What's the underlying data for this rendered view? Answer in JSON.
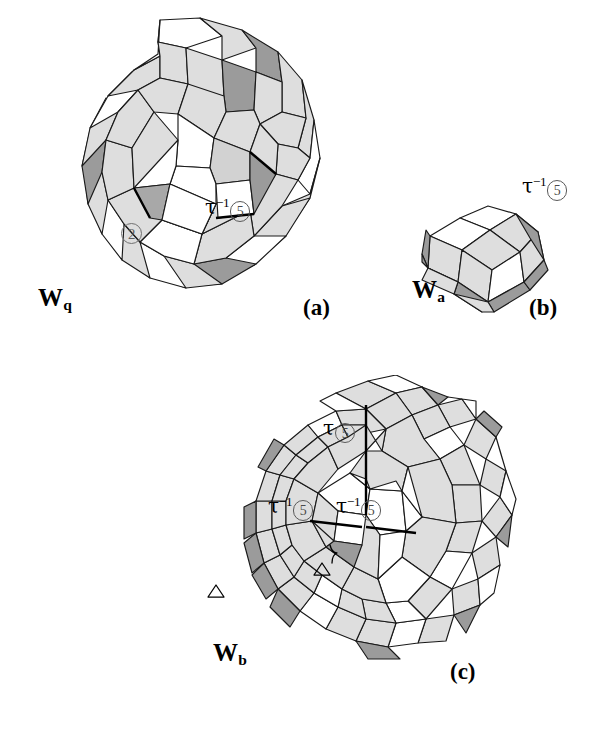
{
  "figure": {
    "type": "scientific-line-drawing",
    "background_color": "#ffffff",
    "face_colors": {
      "white": "#ffffff",
      "light_gray": "#dedede",
      "mid_gray": "#d2d2d2",
      "dark_gray": "#9b9b9b"
    },
    "edge_color": "#1a1a1a"
  },
  "panels": [
    {
      "id": "a",
      "panel_label": "(a)",
      "cluster_label": "W",
      "cluster_subscript": "q",
      "annotations": [
        {
          "name": "tau-inverse-5",
          "tau": "τ",
          "exponent": "−1",
          "circled": "5"
        },
        {
          "name": "circled-2",
          "circled": "2"
        }
      ]
    },
    {
      "id": "b",
      "panel_label": "(b)",
      "cluster_label": "W",
      "cluster_subscript": "a",
      "annotations": [
        {
          "name": "tau-inverse-5",
          "tau": "τ",
          "exponent": "−1",
          "circled": "5"
        }
      ]
    },
    {
      "id": "c",
      "panel_label": "(c)",
      "cluster_label": "W",
      "cluster_subscript": "b",
      "annotations": [
        {
          "name": "tau-5",
          "tau": "τ",
          "exponent": "",
          "circled": "5"
        },
        {
          "name": "tau-inverse-5-left",
          "tau": "τ",
          "exponent": "−1",
          "circled": "5"
        },
        {
          "name": "tau-inverse-5-right",
          "tau": "τ",
          "exponent": "−1",
          "circled": "5"
        },
        {
          "name": "delta-upper",
          "symbol": "Δ"
        },
        {
          "name": "delta-lower",
          "symbol": "Δ"
        }
      ]
    }
  ],
  "labels": {
    "panel_a": "(a)",
    "panel_b": "(b)",
    "panel_c": "(c)",
    "wq_base": "W",
    "wq_sub": "q",
    "wa_base": "W",
    "wa_sub": "a",
    "wb_base": "W",
    "wb_sub": "b",
    "tau": "τ",
    "exp_minus_one": "−1",
    "circled_five": "5",
    "circled_two": "2",
    "delta": "Δ"
  }
}
